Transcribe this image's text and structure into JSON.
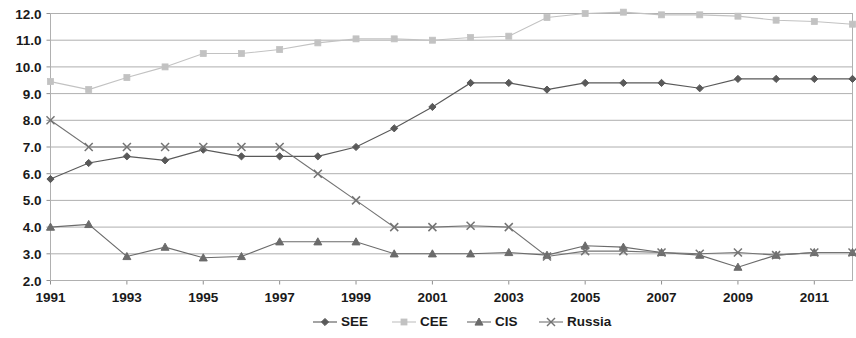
{
  "chart_data": {
    "type": "line",
    "title": "",
    "subtitle": "",
    "xlabel": "",
    "ylabel": "",
    "xlim": [
      1991,
      2012
    ],
    "ylim": [
      2.0,
      12.0
    ],
    "grid": true,
    "legend_position": "bottom",
    "x": [
      1991,
      1992,
      1993,
      1994,
      1995,
      1996,
      1997,
      1998,
      1999,
      2000,
      2001,
      2002,
      2003,
      2004,
      2005,
      2006,
      2007,
      2008,
      2009,
      2010,
      2011,
      2012
    ],
    "xticks": [
      "1991",
      "1993",
      "1995",
      "1997",
      "1999",
      "2001",
      "2003",
      "2005",
      "2007",
      "2009",
      "2011"
    ],
    "xtick_values": [
      1991,
      1993,
      1995,
      1997,
      1999,
      2001,
      2003,
      2005,
      2007,
      2009,
      2011
    ],
    "yticks": [
      "2.0",
      "3.0",
      "4.0",
      "5.0",
      "6.0",
      "7.0",
      "8.0",
      "9.0",
      "10.0",
      "11.0",
      "12.0"
    ],
    "ytick_values": [
      2.0,
      3.0,
      4.0,
      5.0,
      6.0,
      7.0,
      8.0,
      9.0,
      10.0,
      11.0,
      12.0
    ],
    "series": [
      {
        "name": "SEE",
        "marker": "diamond",
        "color": "#595959",
        "values": [
          5.8,
          6.4,
          6.65,
          6.5,
          6.9,
          6.65,
          6.65,
          6.65,
          7.0,
          7.7,
          8.5,
          9.4,
          9.4,
          9.15,
          9.4,
          9.4,
          9.4,
          9.2,
          9.55,
          9.55,
          9.55,
          9.55
        ]
      },
      {
        "name": "CEE",
        "marker": "square",
        "color": "#c2c2c2",
        "values": [
          9.45,
          9.15,
          9.6,
          10.0,
          10.5,
          10.5,
          10.65,
          10.9,
          11.05,
          11.05,
          11.0,
          11.1,
          11.15,
          11.85,
          12.0,
          12.05,
          11.95,
          11.95,
          11.9,
          11.75,
          11.7,
          11.6
        ]
      },
      {
        "name": "CIS",
        "marker": "triangle",
        "color": "#6b6b6b",
        "values": [
          4.0,
          4.1,
          2.9,
          3.25,
          2.85,
          2.9,
          3.45,
          3.45,
          3.45,
          3.0,
          3.0,
          3.0,
          3.05,
          2.95,
          3.3,
          3.25,
          3.05,
          2.95,
          2.5,
          2.95,
          3.05,
          3.05
        ]
      },
      {
        "name": "Russia",
        "marker": "cross",
        "color": "#737373",
        "values": [
          8.0,
          7.0,
          7.0,
          7.0,
          7.0,
          7.0,
          7.0,
          6.0,
          5.0,
          4.0,
          4.0,
          4.05,
          4.0,
          2.9,
          3.1,
          3.1,
          3.05,
          3.0,
          3.05,
          2.95,
          3.05,
          3.05
        ]
      }
    ]
  },
  "legend": {
    "items": [
      {
        "label": "SEE",
        "marker": "diamond",
        "color": "#595959"
      },
      {
        "label": "CEE",
        "marker": "square",
        "color": "#c2c2c2"
      },
      {
        "label": "CIS",
        "marker": "triangle",
        "color": "#6b6b6b"
      },
      {
        "label": "Russia",
        "marker": "cross",
        "color": "#737373"
      }
    ]
  }
}
